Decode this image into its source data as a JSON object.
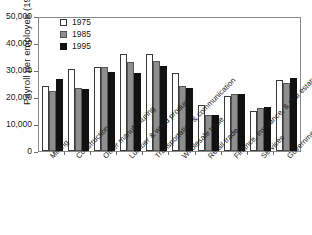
{
  "chart_data": {
    "type": "bar",
    "title": "",
    "xlabel": "",
    "ylabel": "Payroll per employee (1995 $)",
    "ylim": [
      0,
      50000
    ],
    "yticks": [
      0,
      10000,
      20000,
      30000,
      40000,
      50000
    ],
    "ytick_labels": [
      "0",
      "10,000",
      "20,000",
      "30,000",
      "40,000",
      "50,000"
    ],
    "grid": false,
    "legend_position": "top-left",
    "categories": [
      "Mining",
      "Construction",
      "Other manufacturing",
      "Lumber & wood products",
      "Transportation & communication",
      "Wholesale trade",
      "Retail trade",
      "Finance, insurance, & real estate",
      "Services",
      "Government"
    ],
    "series": [
      {
        "name": "1975",
        "color": "#ffffff",
        "values": [
          24000,
          30200,
          31000,
          36000,
          36000,
          28800,
          17000,
          20500,
          15000,
          26200
        ]
      },
      {
        "name": "1985",
        "color": "#8f8f8f",
        "values": [
          22400,
          23400,
          31300,
          33000,
          33300,
          23900,
          13300,
          21000,
          16000,
          25200
        ]
      },
      {
        "name": "1995",
        "color": "#111111",
        "values": [
          26800,
          22900,
          29400,
          29000,
          31500,
          23400,
          13400,
          21000,
          16200,
          27000
        ]
      }
    ]
  },
  "legend": {
    "entries": [
      {
        "label": "1975"
      },
      {
        "label": "1985"
      },
      {
        "label": "1995"
      }
    ]
  }
}
